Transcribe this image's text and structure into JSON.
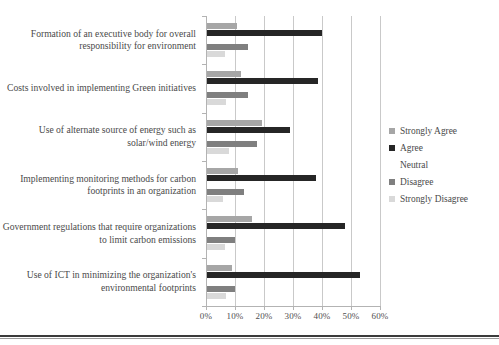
{
  "chart_data": {
    "type": "bar",
    "orientation": "horizontal",
    "title": "",
    "xlabel": "",
    "ylabel": "",
    "xlim": [
      0,
      60
    ],
    "xticks": [
      "0%",
      "10%",
      "20%",
      "30%",
      "40%",
      "50%",
      "60%"
    ],
    "xtick_values": [
      0,
      10,
      20,
      30,
      40,
      50,
      60
    ],
    "grid": true,
    "legend_position": "right",
    "categories": [
      "Formation of an executive body for overall responsibility for environment",
      "Costs involved in implementing Green initiatives",
      "Use of alternate source of energy such as solar/wind energy",
      "Implementing monitoring methods for carbon footprints in an organization",
      "Government regulations that require organizations to limit carbon emissions",
      "Use of ICT in minimizing the organization's environmental footprints"
    ],
    "series": [
      {
        "name": "Strongly Agree",
        "color": "#a6a6a6",
        "values": [
          10.7,
          12.0,
          19.3,
          11.0,
          16.0,
          9.0
        ]
      },
      {
        "name": "Agree",
        "color": "#262626",
        "values": [
          40.0,
          38.5,
          29.0,
          38.0,
          48.0,
          53.0
        ]
      },
      {
        "name": "Neutral",
        "color": "#ffffff",
        "values": [
          0,
          0,
          0,
          0,
          0,
          0
        ]
      },
      {
        "name": "Disagree",
        "color": "#7f7f7f",
        "values": [
          14.5,
          14.5,
          17.6,
          13.0,
          10.0,
          10.0
        ]
      },
      {
        "name": "Strongly Disagree",
        "color": "#d9d9d9",
        "values": [
          6.5,
          7.0,
          8.0,
          6.0,
          6.5,
          7.0
        ]
      }
    ]
  },
  "legend": {
    "items": [
      {
        "label": "Strongly Agree",
        "color": "#a6a6a6"
      },
      {
        "label": "Agree",
        "color": "#262626"
      },
      {
        "label": "Neutral",
        "color": "#ffffff"
      },
      {
        "label": "Disagree",
        "color": "#7f7f7f"
      },
      {
        "label": "Strongly Disagree",
        "color": "#d9d9d9"
      }
    ]
  }
}
